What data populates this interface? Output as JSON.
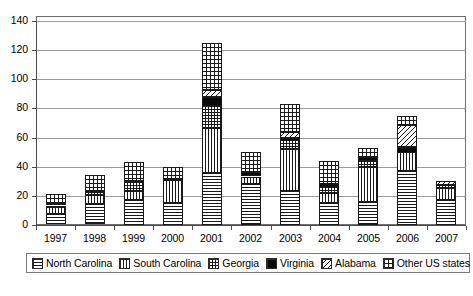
{
  "chart_data": {
    "type": "bar",
    "stacked": true,
    "title": "",
    "subtitle": "",
    "xlabel": "",
    "ylabel": "",
    "ylim": [
      0,
      140
    ],
    "ytick_step": 20,
    "yticks": [
      0,
      20,
      40,
      60,
      80,
      100,
      120,
      140
    ],
    "grid": true,
    "legend_position": "bottom",
    "categories": [
      "1997",
      "1998",
      "1999",
      "2000",
      "2001",
      "2002",
      "2003",
      "2004",
      "2005",
      "2006",
      "2007"
    ],
    "series": [
      {
        "name": "North Carolina",
        "pattern": "horizontal-lines",
        "values": [
          7,
          14,
          17,
          15,
          36,
          28,
          23,
          15,
          16,
          37,
          17
        ]
      },
      {
        "name": "South Carolina",
        "pattern": "vertical-lines",
        "values": [
          5,
          6,
          6,
          16,
          31,
          5,
          29,
          7,
          24,
          13,
          8
        ]
      },
      {
        "name": "Georgia",
        "pattern": "cross-grid",
        "values": [
          1,
          2,
          6,
          0,
          15,
          0,
          6,
          4,
          4,
          0,
          2
        ]
      },
      {
        "name": "Virginia",
        "pattern": "solid-black",
        "values": [
          1,
          1,
          1,
          1,
          6,
          3,
          2,
          2,
          3,
          4,
          0
        ]
      },
      {
        "name": "Alabama",
        "pattern": "diagonal-lines",
        "values": [
          0,
          0,
          0,
          0,
          5,
          0,
          4,
          0,
          0,
          15,
          3
        ]
      },
      {
        "name": "Other US states",
        "pattern": "fine-grid",
        "values": [
          7,
          11,
          13,
          8,
          32,
          14,
          19,
          16,
          6,
          6,
          0
        ]
      }
    ],
    "totals": [
      21,
      34,
      43,
      40,
      125,
      50,
      83,
      44,
      53,
      75,
      30
    ]
  },
  "axes": {
    "y_tick_labels": [
      "140",
      "120",
      "100",
      "80",
      "60",
      "40",
      "20",
      "0"
    ],
    "x_tick_labels": [
      "1997",
      "1998",
      "1999",
      "2000",
      "2001",
      "2002",
      "2003",
      "2004",
      "2005",
      "2006",
      "2007"
    ]
  },
  "legend": {
    "items": [
      {
        "label": "North Carolina",
        "pattern": "horizontal-lines"
      },
      {
        "label": "South Carolina",
        "pattern": "vertical-lines"
      },
      {
        "label": "Georgia",
        "pattern": "cross-grid"
      },
      {
        "label": "Virginia",
        "pattern": "solid-black"
      },
      {
        "label": "Alabama",
        "pattern": "diagonal-lines"
      },
      {
        "label": "Other US states",
        "pattern": "fine-grid"
      }
    ]
  },
  "caption": {
    "text": ""
  },
  "colors": {
    "ink": "#000000",
    "grid": "#9a9a9a",
    "axis": "#4a4a4a",
    "frame": "#6f6f6f",
    "plot_background": "#ffffff"
  }
}
